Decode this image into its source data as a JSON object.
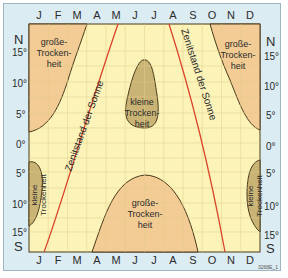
{
  "months_top": [
    "J",
    "F",
    "M",
    "A",
    "M",
    "J",
    "J",
    "A",
    "S",
    "O",
    "N",
    "D"
  ],
  "months_bottom": [
    "J",
    "F",
    "M",
    "A",
    "M",
    "J",
    "J",
    "A",
    "S",
    "O",
    "N",
    "D"
  ],
  "latitudes_left": [
    "15°",
    "10°",
    "5°",
    "0°",
    "5°",
    "10°",
    "15°"
  ],
  "latitudes_right": [
    "15°",
    "10°",
    "5°",
    "0°",
    "5°",
    "10°",
    "15°"
  ],
  "north_label": "N",
  "south_label": "S",
  "regions": {
    "big_dry_nw": [
      "große-",
      "Trocken-",
      "heit"
    ],
    "big_dry_ne": [
      "große-",
      "Trocken-",
      "heit"
    ],
    "big_dry_s": [
      "große-",
      "Trocken-",
      "heit"
    ],
    "small_dry_center": [
      "kleine",
      "Trocken-",
      "heit"
    ],
    "small_dry_w": [
      "kleine",
      "Trockenheit"
    ],
    "small_dry_e": [
      "kleine",
      "Trockenheit"
    ]
  },
  "sun_label_left": "Zenitstand der Sonne",
  "sun_label_right": "Zenitstand der Sonne",
  "figure_code": "3268E_1",
  "colors": {
    "background": "#fbf3b8",
    "big_dry": "#f3cb95",
    "small_dry": "#c9b476",
    "grid": "#e6d89a",
    "sun_line": "#d9442a",
    "boundary": "#4a3a1a",
    "frame": "#dcecf3"
  }
}
